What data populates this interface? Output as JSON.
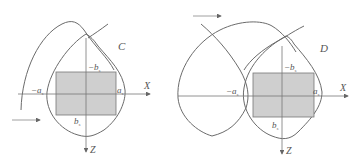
{
  "figure": {
    "panels": [
      {
        "id": "C",
        "label": "C",
        "axis_x": "X",
        "axis_z": "Z",
        "neg_a": "−a",
        "pos_a": "a",
        "neg_b": "−b",
        "pos_b": "b",
        "subscript": "s"
      },
      {
        "id": "D",
        "label": "D",
        "axis_x": "X",
        "axis_z": "Z",
        "neg_a": "−a",
        "pos_a": "a",
        "neg_b": "−b",
        "pos_b": "b",
        "subscript": "s"
      }
    ],
    "colors": {
      "curve": "#6b6b6b",
      "rect_fill": "#cfcfcf",
      "rect_stroke": "#777777",
      "axis": "#777777",
      "text": "#555555"
    }
  }
}
